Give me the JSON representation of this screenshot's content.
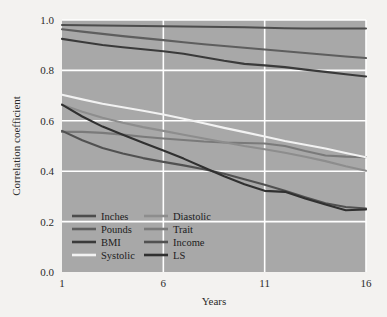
{
  "figure": {
    "background_color": "#f3f2f0",
    "plot_background_color": "#a8a8a8",
    "grid_color": "#ffffff"
  },
  "axes": {
    "y_title": "Correlation coefficient",
    "x_title": "Years",
    "y_ticks": [
      "0.0",
      "0.2",
      "0.4",
      "0.6",
      "0.8",
      "1.0"
    ],
    "x_ticks": [
      "1",
      "6",
      "11",
      "16"
    ]
  },
  "legend": {
    "items": [
      {
        "label": "Inches",
        "color": "#4d4d4d"
      },
      {
        "label": "Pounds",
        "color": "#5e5e5e"
      },
      {
        "label": "BMI",
        "color": "#3a3a3a"
      },
      {
        "label": "Systolic",
        "color": "#f2f2f2"
      },
      {
        "label": "Diastolic",
        "color": "#8d8d8d"
      },
      {
        "label": "Trait",
        "color": "#7a7a7a"
      },
      {
        "label": "Income",
        "color": "#515151"
      },
      {
        "label": "LS",
        "color": "#303030"
      }
    ]
  },
  "chart_data": {
    "type": "line",
    "title": "",
    "xlabel": "Years",
    "ylabel": "Correlation coefficient",
    "xlim": [
      1,
      16
    ],
    "ylim": [
      0.0,
      1.0
    ],
    "grid": true,
    "legend_position": "inside-bottom-left",
    "x": [
      1,
      2,
      3,
      4,
      5,
      6,
      7,
      8,
      9,
      10,
      11,
      12,
      13,
      14,
      15,
      16
    ],
    "series": [
      {
        "name": "Inches",
        "color": "#4d4d4d",
        "values": [
          0.98,
          0.979,
          0.978,
          0.977,
          0.976,
          0.975,
          0.974,
          0.973,
          0.972,
          0.971,
          0.969,
          0.967,
          0.966,
          0.966,
          0.966,
          0.966
        ]
      },
      {
        "name": "Pounds",
        "color": "#5e5e5e",
        "values": [
          0.963,
          0.954,
          0.945,
          0.936,
          0.928,
          0.92,
          0.912,
          0.904,
          0.897,
          0.89,
          0.883,
          0.876,
          0.869,
          0.862,
          0.855,
          0.849
        ]
      },
      {
        "name": "BMI",
        "color": "#3a3a3a",
        "values": [
          0.925,
          0.913,
          0.901,
          0.892,
          0.884,
          0.876,
          0.866,
          0.852,
          0.838,
          0.826,
          0.82,
          0.813,
          0.803,
          0.794,
          0.785,
          0.776
        ]
      },
      {
        "name": "Systolic",
        "color": "#f2f2f2",
        "values": [
          0.703,
          0.685,
          0.668,
          0.654,
          0.64,
          0.625,
          0.608,
          0.59,
          0.572,
          0.555,
          0.538,
          0.52,
          0.505,
          0.49,
          0.472,
          0.455
        ]
      },
      {
        "name": "Diastolic",
        "color": "#8d8d8d",
        "values": [
          0.664,
          0.636,
          0.612,
          0.592,
          0.575,
          0.56,
          0.545,
          0.53,
          0.515,
          0.5,
          0.487,
          0.473,
          0.457,
          0.44,
          0.42,
          0.402
        ]
      },
      {
        "name": "Trait",
        "color": "#7a7a7a",
        "values": [
          0.556,
          0.556,
          0.552,
          0.545,
          0.537,
          0.53,
          0.524,
          0.518,
          0.514,
          0.512,
          0.51,
          0.5,
          0.48,
          0.462,
          0.458,
          0.456
        ]
      },
      {
        "name": "Income",
        "color": "#515151",
        "values": [
          0.56,
          0.523,
          0.492,
          0.47,
          0.452,
          0.437,
          0.423,
          0.408,
          0.39,
          0.368,
          0.346,
          0.322,
          0.297,
          0.273,
          0.258,
          0.252
        ]
      },
      {
        "name": "LS",
        "color": "#303030",
        "values": [
          0.664,
          0.617,
          0.577,
          0.545,
          0.513,
          0.482,
          0.45,
          0.415,
          0.38,
          0.348,
          0.322,
          0.318,
          0.292,
          0.268,
          0.245,
          0.248
        ]
      }
    ]
  }
}
